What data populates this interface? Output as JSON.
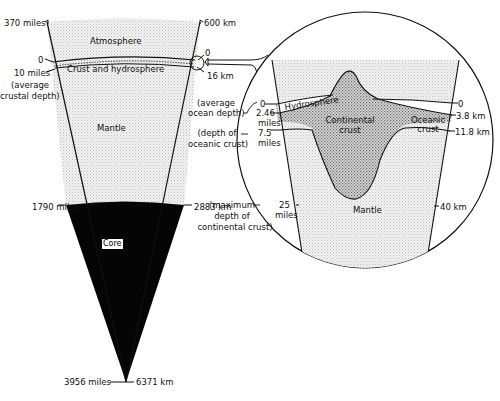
{
  "diagram": {
    "wedge": {
      "layers": {
        "atmosphere": "Atmosphere",
        "crust_hydrosphere": "Crust and hydrosphere",
        "mantle": "Mantle",
        "core": "Core"
      },
      "left_scale": {
        "top": "370 miles",
        "surface": "0",
        "crust": "10 miles",
        "crust_note_1": "(average",
        "crust_note_2": "crustal depth)",
        "core_boundary": "1790 miles",
        "center": "3956 miles"
      },
      "right_scale": {
        "top": "600 km",
        "surface": "0",
        "crust": "16 km",
        "core_boundary": "2883 km",
        "center": "6371 km"
      }
    },
    "inset": {
      "layers": {
        "hydrosphere": "Hydrosphere",
        "continental_crust_1": "Continental",
        "continental_crust_2": "crust",
        "oceanic_crust_1": "Oceanic",
        "oceanic_crust_2": "crust",
        "mantle": "Mantle"
      },
      "left_scale": {
        "surface": "0",
        "ocean_depth": "2.46",
        "ocean_depth_unit": "miles",
        "ocean_note_1": "(average",
        "ocean_note_2": "ocean depth)",
        "oceanic_crust": "7.5",
        "oceanic_crust_unit": "miles",
        "oceanic_note_1": "(depth of",
        "oceanic_note_2": "oceanic crust)",
        "continental_max": "25",
        "continental_max_unit": "miles",
        "continental_note_1": "(maximum",
        "continental_note_2": "depth of",
        "continental_note_3": "continental crust)"
      },
      "right_scale": {
        "surface": "0",
        "ocean_depth": "3.8 km",
        "oceanic_crust": "11.8 km",
        "continental_max": "40 km"
      }
    }
  }
}
